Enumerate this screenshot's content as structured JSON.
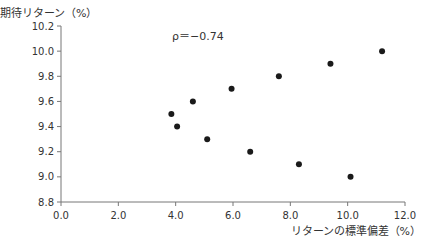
{
  "chart_data": {
    "type": "scatter",
    "title": "",
    "xlabel": "リターンの標準偏差（%）",
    "ylabel": "期待リターン（%）",
    "annotation": "ρ＝−0.74",
    "xlim": [
      0.0,
      12.0
    ],
    "ylim": [
      8.8,
      10.2
    ],
    "xticks": [
      "0.0",
      "2.0",
      "4.0",
      "6.0",
      "8.0",
      "10.0",
      "12.0"
    ],
    "yticks": [
      "8.8",
      "9.0",
      "9.2",
      "9.4",
      "9.6",
      "9.8",
      "10.0",
      "10.2"
    ],
    "grid": false,
    "legend": null,
    "points": [
      {
        "x": 3.85,
        "y": 9.5
      },
      {
        "x": 4.05,
        "y": 9.4
      },
      {
        "x": 4.6,
        "y": 9.6
      },
      {
        "x": 5.1,
        "y": 9.3
      },
      {
        "x": 5.95,
        "y": 9.7
      },
      {
        "x": 6.6,
        "y": 9.2
      },
      {
        "x": 7.6,
        "y": 9.8
      },
      {
        "x": 8.3,
        "y": 9.1
      },
      {
        "x": 9.4,
        "y": 9.9
      },
      {
        "x": 10.1,
        "y": 9.0
      },
      {
        "x": 11.2,
        "y": 10.0
      }
    ],
    "marker_color": "#1a1a1a"
  }
}
